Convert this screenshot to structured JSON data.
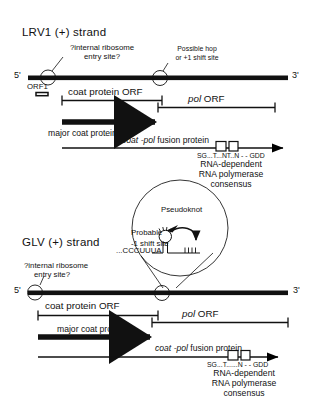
{
  "figure": {
    "type": "diagram",
    "panels": [
      {
        "id": "lrv1",
        "title": "LRV1 (+) strand",
        "genome": {
          "five_prime": "5'",
          "three_prime": "3'",
          "markers": [
            {
              "name": "ires",
              "label_line1": "?internal ribosome",
              "label_line2": "entry site?"
            },
            {
              "name": "hop-site",
              "label_line1": "Possible hop",
              "label_line2": "or +1 shift site"
            }
          ],
          "orf1_label": "ORF1"
        },
        "orfs": [
          {
            "name": "coat-protein-orf",
            "label": "coat protein ORF",
            "italic": false
          },
          {
            "name": "pol-orf",
            "label_italic": "pol",
            "label_rest": "ORF"
          }
        ],
        "products": [
          {
            "name": "major-coat-protein",
            "label": "major coat protein"
          },
          {
            "name": "coat-pol-fusion-protein",
            "label_italic": "coat -pol",
            "label_rest": "fusion protein"
          }
        ],
        "motif": {
          "consensus_sequence": "SG...T...NT..N - - GDD",
          "caption_line1": "RNA-dependent",
          "caption_line2": "RNA polymerase",
          "caption_line3": "consensus"
        }
      },
      {
        "id": "glv",
        "title": "GLV (+) strand",
        "genome": {
          "five_prime": "5'",
          "three_prime": "3'",
          "markers": [
            {
              "name": "ires",
              "label_line1": "?internal ribosome",
              "label_line2": "entry site?"
            },
            {
              "name": "shift-site",
              "label_line1": "",
              "label_line2": ""
            }
          ]
        },
        "orfs": [
          {
            "name": "coat-protein-orf",
            "label": "coat protein ORF",
            "italic": false
          },
          {
            "name": "pol-orf",
            "label_italic": "pol",
            "label_rest": "ORF"
          }
        ],
        "products": [
          {
            "name": "major-coat-protein",
            "label": "major coat protein"
          },
          {
            "name": "coat-pol-fusion-protein",
            "label_italic": "coat -pol",
            "label_rest": "fusion protein"
          }
        ],
        "motif": {
          "consensus_sequence": "SG...T......N - - GDD",
          "caption_line1": "RNA-dependent",
          "caption_line2": "RNA polymerase",
          "caption_line3": "consensus"
        }
      }
    ],
    "inset": {
      "name": "pseudoknot-inset",
      "pseudoknot_label": "Pseudoknot",
      "shift_site_line1": "Probable",
      "shift_site_line2": "-1 shift site",
      "sequence": "...CCCUUUA"
    },
    "colors": {
      "ink": "#111111",
      "line": "#000000",
      "background": "#ffffff"
    }
  }
}
